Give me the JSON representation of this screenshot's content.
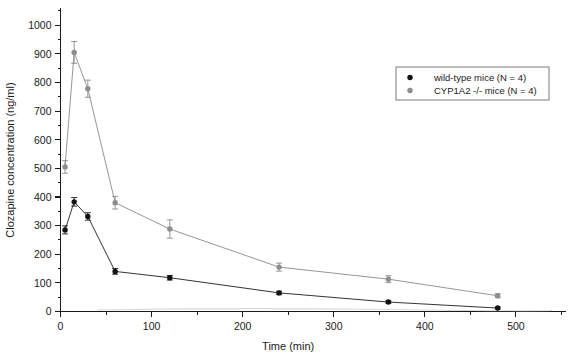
{
  "chart_data": {
    "type": "line",
    "title": "",
    "xlabel": "Time (min)",
    "ylabel": "Clozapine concentration (ng/ml)",
    "xlim": [
      0,
      555
    ],
    "ylim": [
      0,
      1060
    ],
    "xticks": [
      0,
      100,
      200,
      300,
      400,
      500
    ],
    "yticks": [
      0,
      100,
      200,
      300,
      400,
      500,
      600,
      700,
      800,
      900,
      1000
    ],
    "xtick_labels": [
      "0",
      "100",
      "200",
      "300",
      "400",
      "500"
    ],
    "ytick_labels": [
      "0",
      "100",
      "200",
      "300",
      "400",
      "500",
      "600",
      "700",
      "800",
      "900",
      "1000"
    ],
    "x_minor_interval": 50,
    "y_minor_interval": 50,
    "grid": false,
    "legend_position": "top-right",
    "x": [
      5,
      15,
      30,
      60,
      120,
      240,
      360,
      480
    ],
    "series": [
      {
        "name": "wild-type mice (N = 4)",
        "color": "#111111",
        "marker": "circle",
        "values": [
          285,
          383,
          332,
          140,
          118,
          65,
          33,
          12
        ],
        "errors": [
          14,
          15,
          13,
          10,
          8,
          6,
          4,
          3
        ]
      },
      {
        "name": "CYP1A2 -/- mice (N = 4)",
        "color": "#8d8d8d",
        "marker": "circle",
        "values": [
          505,
          905,
          778,
          380,
          288,
          155,
          113,
          55
        ],
        "errors": [
          22,
          38,
          30,
          22,
          32,
          14,
          12,
          7
        ]
      }
    ]
  },
  "legend": {
    "items": [
      {
        "label": "wild-type mice (N = 4)",
        "marker_color": "#111111"
      },
      {
        "label": "CYP1A2 -/- mice (N = 4)",
        "marker_color": "#8d8d8d"
      }
    ]
  },
  "axes": {
    "x_title": "Time (min)",
    "y_title": "Clozapine concentration (ng/ml)"
  }
}
